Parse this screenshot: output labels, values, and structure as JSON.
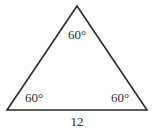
{
  "figure": {
    "name": "equilateral-triangle",
    "background_color": "#ffffff",
    "stroke_color": "#2b2b2b",
    "stroke_width": 1.6,
    "text_color": "#2b2b2b",
    "vertices": {
      "apex": {
        "x": 77,
        "y": 6
      },
      "bottom_left": {
        "x": 7,
        "y": 110
      },
      "bottom_right": {
        "x": 147,
        "y": 110
      }
    },
    "polygon_points": "77,6 147,110 7,110",
    "angles": {
      "apex": "60°",
      "bottom_left": "60°",
      "bottom_right": "60°"
    },
    "sides": {
      "base": "12"
    }
  }
}
